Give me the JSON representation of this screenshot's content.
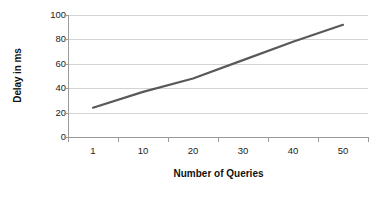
{
  "chart_data": {
    "type": "line",
    "title": "",
    "subtitle": "",
    "xlabel": "Number of Queries",
    "ylabel": "Delay in ms",
    "categories": [
      "1",
      "10",
      "20",
      "30",
      "40",
      "50"
    ],
    "x_values": [
      1,
      10,
      20,
      30,
      40,
      50
    ],
    "series": [
      {
        "name": "Delay",
        "color": "#595959",
        "values": [
          24,
          37,
          48,
          63,
          78,
          92
        ]
      }
    ],
    "ylim": [
      0,
      100
    ],
    "y_ticks": [
      0,
      20,
      40,
      60,
      80,
      100
    ],
    "y_tick_labels": [
      "0",
      "20",
      "40",
      "60",
      "80",
      "100"
    ],
    "x_tick_labels": [
      "1",
      "10",
      "20",
      "30",
      "40",
      "50"
    ],
    "grid": {
      "horizontal": true,
      "vertical": false,
      "color": "#d4d4d4"
    },
    "legend": {
      "visible": false,
      "position": "none",
      "entries": []
    },
    "axis_color": "#9a9a9a",
    "background_color": "#ffffff",
    "line_width_px": 2.2,
    "markers": false
  }
}
